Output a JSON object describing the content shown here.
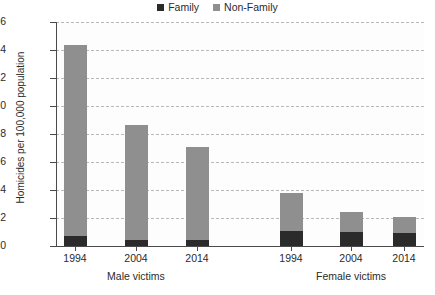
{
  "chart_data": {
    "type": "bar",
    "subtype": "stacked-bar-grouped",
    "title": "",
    "xlabel": "",
    "ylabel": "Homicides per 100,000 population",
    "ylim": [
      0,
      16
    ],
    "ytick_step": 2,
    "yticks": [
      "16",
      "14",
      "12",
      "10",
      "8",
      "6",
      "4",
      "2",
      "0"
    ],
    "grid": true,
    "grid_style": "dashed-horizontal",
    "legend_position": "top-center",
    "groups": [
      "Male victims",
      "Female victims"
    ],
    "categories": [
      "1994",
      "2004",
      "2014",
      "1994",
      "2004",
      "2014"
    ],
    "series": [
      {
        "name": "Family",
        "color": "#2b2b2b",
        "values": [
          0.75,
          0.45,
          0.45,
          1.05,
          1.0,
          0.95
        ]
      },
      {
        "name": "Non-Family",
        "color": "#8f8f8f",
        "values": [
          13.6,
          8.2,
          6.65,
          2.75,
          1.45,
          1.15
        ]
      }
    ],
    "totals": [
      14.35,
      8.65,
      7.1,
      3.8,
      2.45,
      2.1
    ]
  },
  "legend": {
    "items": [
      {
        "label": "Family",
        "color": "#2b2b2b"
      },
      {
        "label": "Non-Family",
        "color": "#8f8f8f"
      }
    ]
  },
  "axes": {
    "y_title": "Homicides per 100,000 population",
    "y_ticks": [
      "16",
      "14",
      "12",
      "10",
      "8",
      "6",
      "4",
      "2",
      "0"
    ],
    "x_ticks": [
      "1994",
      "2004",
      "2014",
      "1994",
      "2004",
      "2014"
    ],
    "group_labels": [
      "Male victims",
      "Female victims"
    ]
  },
  "colors": {
    "family": "#2b2b2b",
    "non_family": "#8f8f8f",
    "axis": "#4a4a4a",
    "grid": "#b9b9b9",
    "background": "#ffffff"
  }
}
